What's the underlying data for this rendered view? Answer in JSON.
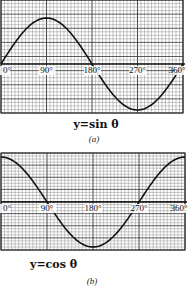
{
  "chart_data": [
    {
      "type": "line",
      "title": "y=sin θ",
      "caption": "(a)",
      "x": [
        0,
        90,
        180,
        270,
        360
      ],
      "series": [
        {
          "name": "sin θ",
          "values": [
            0,
            1,
            0,
            -1,
            0
          ]
        }
      ],
      "tick_labels": [
        "0°",
        "90°",
        "180°",
        "270°",
        "360°"
      ],
      "xlabel": "θ",
      "ylabel": "y",
      "ylim": [
        -1,
        1
      ],
      "xlim": [
        0,
        360
      ],
      "grid": true
    },
    {
      "type": "line",
      "title": "y=cos θ",
      "caption": "(b)",
      "x": [
        0,
        90,
        180,
        270,
        360
      ],
      "series": [
        {
          "name": "cos θ",
          "values": [
            1,
            0,
            -1,
            0,
            1
          ]
        }
      ],
      "tick_labels": [
        "0°",
        "90°",
        "180°",
        "270°",
        "360°"
      ],
      "xlabel": "θ",
      "ylabel": "y",
      "ylim": [
        -1,
        1
      ],
      "xlim": [
        0,
        360
      ],
      "grid": true
    }
  ]
}
